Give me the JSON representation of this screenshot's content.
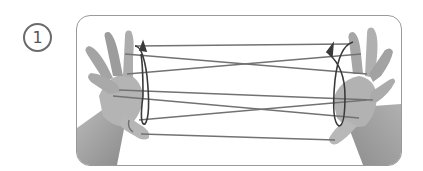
{
  "step": {
    "number": "1"
  },
  "illustration": {
    "subject": "cat's cradle string figure, two hands",
    "colors": {
      "frame_border": "#9a9a9a",
      "badge_border": "#6b6b6b",
      "skin_light": "#c9c9c9",
      "skin_mid": "#a8a8a8",
      "skin_dark": "#8a8a8a",
      "string": "#6e6e6e",
      "arrow": "#3a3a3a"
    },
    "arrows": [
      {
        "name": "left-rotation-arrow",
        "direction": "counter-clockwise loop upward"
      },
      {
        "name": "right-rotation-arrow",
        "direction": "clockwise loop upward"
      }
    ]
  }
}
